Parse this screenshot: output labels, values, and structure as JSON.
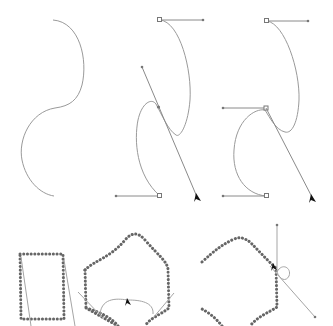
{
  "figure": {
    "panels": [
      {
        "id": "panel-1",
        "label": "S-curve without handles"
      },
      {
        "id": "panel-2",
        "label": "S-curve with dragged handle"
      },
      {
        "id": "panel-3",
        "label": "S-curve with corner handle"
      },
      {
        "id": "panel-4",
        "label": "Dotted rectangle path"
      },
      {
        "id": "panel-5",
        "label": "Dotted hexagon with loop handle"
      },
      {
        "id": "panel-6",
        "label": "Dotted hexagon with vertical handle"
      }
    ],
    "colors": {
      "background": "#ffffff",
      "curve": "#9a9a9a",
      "handle": "#8a8a8a",
      "dotted_path": "#666666",
      "cursor": "#111111"
    },
    "icons": [
      "arrow-cursor-icon"
    ]
  }
}
